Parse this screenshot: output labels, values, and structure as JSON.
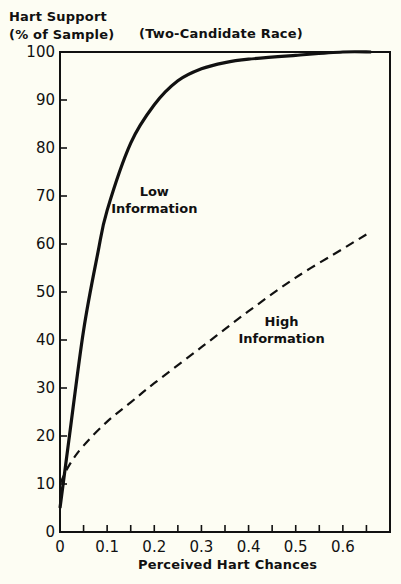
{
  "chart_data": {
    "type": "line",
    "title": "(Two-Candidate Race)",
    "ylabel_lines": [
      "Hart Support",
      "(% of Sample)"
    ],
    "xlabel": "Perceived Hart Chances",
    "xlim": [
      0,
      0.7
    ],
    "ylim": [
      0,
      100
    ],
    "grid": false,
    "x_ticks": [
      0,
      0.1,
      0.2,
      0.3,
      0.4,
      0.5,
      0.6
    ],
    "x_tick_labels": [
      "0",
      "0.1",
      "0.2",
      "0.3",
      "0.4",
      "0.5",
      "0.6"
    ],
    "x_minor_ticks": [
      0.05,
      0.15,
      0.25,
      0.35,
      0.45,
      0.55,
      0.65
    ],
    "y_ticks": [
      0,
      10,
      20,
      30,
      40,
      50,
      60,
      70,
      80,
      90,
      100
    ],
    "y_tick_labels": [
      "0",
      "10",
      "20",
      "30",
      "40",
      "50",
      "60",
      "70",
      "80",
      "90",
      "100"
    ],
    "series": [
      {
        "name": "Low Information",
        "style": "solid",
        "label_lines": [
          "Low",
          "Information"
        ],
        "label_pos": [
          0.2,
          70
        ],
        "x": [
          0,
          0.02,
          0.05,
          0.08,
          0.1,
          0.15,
          0.2,
          0.25,
          0.3,
          0.35,
          0.4,
          0.5,
          0.6,
          0.66
        ],
        "y": [
          5,
          20,
          42,
          58,
          67,
          81,
          89,
          94,
          96.5,
          97.8,
          98.5,
          99.3,
          100,
          100
        ]
      },
      {
        "name": "High Information",
        "style": "dashed",
        "label_lines": [
          "High",
          "Information"
        ],
        "label_pos": [
          0.47,
          43
        ],
        "x": [
          0,
          0.02,
          0.05,
          0.1,
          0.15,
          0.2,
          0.3,
          0.4,
          0.5,
          0.6,
          0.65
        ],
        "y": [
          10,
          14,
          18,
          23,
          27,
          31,
          38.5,
          46,
          53,
          59,
          62
        ]
      }
    ]
  },
  "labels": {
    "ylabel_line1": "Hart Support",
    "ylabel_line2": "(% of Sample)",
    "subtitle": "(Two-Candidate Race)",
    "xlabel": "Perceived Hart Chances"
  }
}
